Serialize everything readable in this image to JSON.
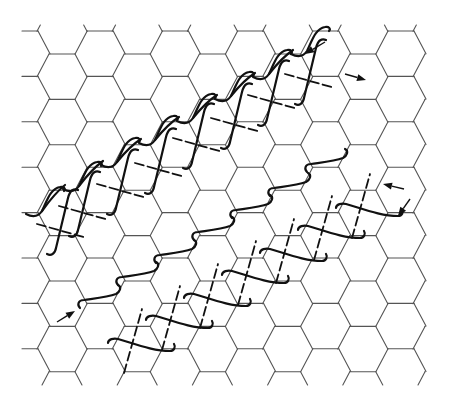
{
  "figure": {
    "title": "",
    "lattice": {
      "type": "honeycomb",
      "columns": 6,
      "rows": 8,
      "line_color": "#555555"
    },
    "helices": [
      {
        "name": "upper-single-strand",
        "turns": 8,
        "style": "solid"
      },
      {
        "name": "upper-double-helix",
        "turns": 7,
        "style": "solid+dashed"
      },
      {
        "name": "middle-single-strand",
        "turns": 5,
        "style": "solid"
      },
      {
        "name": "lower-double-helix",
        "turns": 7,
        "style": "solid+dashed"
      }
    ],
    "arrows": [
      {
        "name": "arrow-upper-end-in",
        "direction": "down-left"
      },
      {
        "name": "arrow-upper-end-out",
        "direction": "right"
      },
      {
        "name": "arrow-right-end-in",
        "direction": "left"
      },
      {
        "name": "arrow-right-end-down",
        "direction": "down-left"
      },
      {
        "name": "arrow-lower-start",
        "direction": "up-right"
      }
    ],
    "colors": {
      "background": "#ffffff",
      "lattice": "#555555",
      "helix": "#111111"
    }
  }
}
